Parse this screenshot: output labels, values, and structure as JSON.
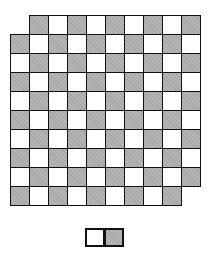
{
  "diagram": {
    "title": "",
    "type": "mutilated-checkerboard",
    "board": {
      "rows": 10,
      "cols": 10,
      "cell_size_px": 19,
      "dark_rule": "(row+col) odd",
      "removed_cells": [
        [
          0,
          0
        ],
        [
          9,
          9
        ]
      ],
      "colors": {
        "dark": "#b4b4b4",
        "light": "#ffffff",
        "grid": "#111111"
      }
    },
    "domino": {
      "cells": [
        "light",
        "dark"
      ]
    }
  }
}
